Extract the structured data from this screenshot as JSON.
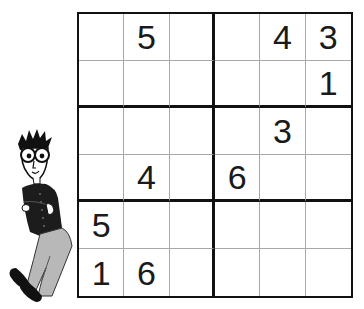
{
  "puzzle": {
    "type": "sudoku-6x6",
    "size": 6,
    "box_rows": 2,
    "box_cols": 3,
    "grid": [
      [
        "",
        "5",
        "",
        "",
        "4",
        "3"
      ],
      [
        "",
        "",
        "",
        "",
        "",
        "1"
      ],
      [
        "",
        "",
        "",
        "",
        "3",
        ""
      ],
      [
        "",
        "4",
        "",
        "6",
        "",
        ""
      ],
      [
        "5",
        "",
        "",
        "",
        "",
        ""
      ],
      [
        "1",
        "6",
        "",
        "",
        "",
        ""
      ]
    ]
  },
  "illustration": {
    "icon": "cartoon-man-leaning-icon",
    "description": "Cartoon man with spiky hair and round glasses leaning against the grid"
  },
  "colors": {
    "grid_thick_line": "#111111",
    "grid_thin_line": "#a8a8a8",
    "digit": "#1a1a1a",
    "background": "#ffffff"
  }
}
